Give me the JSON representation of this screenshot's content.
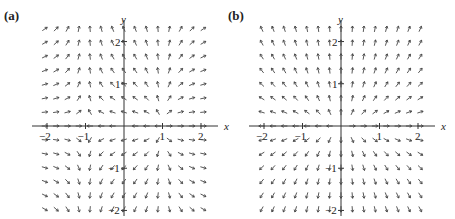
{
  "figure": {
    "panels": [
      {
        "label": "(a)",
        "x_axis_label": "x",
        "y_axis_label": "y",
        "x_ticks": [
          "−2",
          "−1",
          "1",
          "2"
        ],
        "y_ticks": [
          "2",
          "1",
          "−1",
          "−2"
        ]
      },
      {
        "label": "(b)",
        "x_axis_label": "x",
        "y_axis_label": "y",
        "x_ticks": [
          "−2",
          "−1",
          "1",
          "2"
        ],
        "y_ticks": [
          "2",
          "1",
          "−1",
          "−2"
        ]
      }
    ]
  },
  "chart_data": [
    {
      "type": "vector_field",
      "title": "(a)",
      "xlabel": "x",
      "ylabel": "y",
      "xlim": [
        -2.2,
        2.2
      ],
      "ylim": [
        -2.2,
        2.2
      ],
      "grid": false,
      "field_description": "normalized arrows; vertical along x=±1, tilted left between x=-1 and 1, right outside; up for y>0, down for y<0",
      "approx_field": {
        "u": "x^2-1",
        "v": "y"
      }
    },
    {
      "type": "vector_field",
      "title": "(b)",
      "xlabel": "x",
      "ylabel": "y",
      "xlim": [
        -2.2,
        2.2
      ],
      "ylim": [
        -2.2,
        2.2
      ],
      "grid": false,
      "field_description": "normalized arrows pointing outward from origin; nearly vertical away from x-axis",
      "approx_field": {
        "u": "x",
        "v": "2y"
      }
    }
  ]
}
